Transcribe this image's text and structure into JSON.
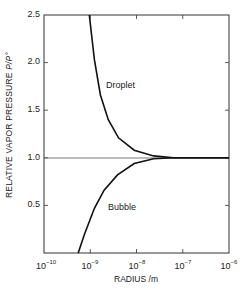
{
  "chart_data": {
    "type": "line",
    "title": "",
    "xlabel": "RADIUS /m",
    "ylabel": "RELATIVE VAPOR PRESSURE P/P°",
    "xscale": "log",
    "xlim": [
      1e-10,
      1e-06
    ],
    "ylim": [
      0,
      2.5
    ],
    "x_ticks": [
      "10^-10",
      "10^-9",
      "10^-8",
      "10^-7",
      "10^-6"
    ],
    "y_ticks": [
      "0.5",
      "1.0",
      "1.5",
      "2.0",
      "2.5"
    ],
    "grid": false,
    "legend": "inline labels",
    "reference_line": {
      "y": 1.0
    },
    "series": [
      {
        "name": "Droplet",
        "log10_radius": [
          -9.02,
          -8.91,
          -8.78,
          -8.61,
          -8.39,
          -8.05,
          -7.63,
          -7.2,
          -6.0
        ],
        "values": [
          2.5,
          2.03,
          1.66,
          1.4,
          1.21,
          1.08,
          1.02,
          1.0,
          1.0
        ]
      },
      {
        "name": "Bubble",
        "log10_radius": [
          -9.26,
          -9.13,
          -8.91,
          -8.7,
          -8.41,
          -8.05,
          -7.63,
          -7.2,
          -6.0
        ],
        "values": [
          0.0,
          0.19,
          0.47,
          0.66,
          0.82,
          0.94,
          0.99,
          1.0,
          1.0
        ]
      }
    ]
  },
  "labels": {
    "y_axis_main": "RELATIVE VAPOR PRESSURE ",
    "y_axis_italic": "P/P°",
    "x_axis": "RADIUS /m",
    "droplet": "Droplet",
    "bubble": "Bubble",
    "ytick_25": "2.5",
    "ytick_20": "2.0",
    "ytick_15": "1.5",
    "ytick_10": "1.0",
    "ytick_05": "0.5",
    "xtick_base": "10",
    "xexp_10": "−10",
    "xexp_9": "−9",
    "xexp_8": "−8",
    "xexp_7": "−7",
    "xexp_6": "−6"
  }
}
